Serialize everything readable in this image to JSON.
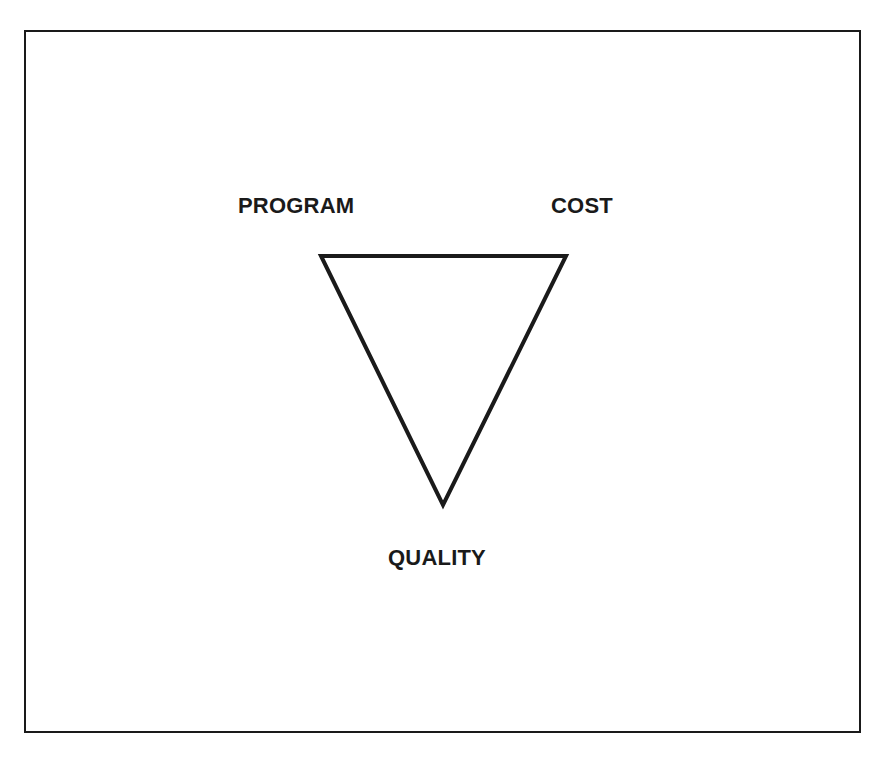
{
  "diagram": {
    "type": "inverted-triangle",
    "vertices": [
      {
        "id": "program",
        "label": "PROGRAM",
        "x": 321,
        "y": 256
      },
      {
        "id": "cost",
        "label": "COST",
        "x": 566,
        "y": 256
      },
      {
        "id": "quality",
        "label": "QUALITY",
        "x": 443,
        "y": 505
      }
    ],
    "stroke_color": "#1a1a1a",
    "stroke_width": 4
  }
}
